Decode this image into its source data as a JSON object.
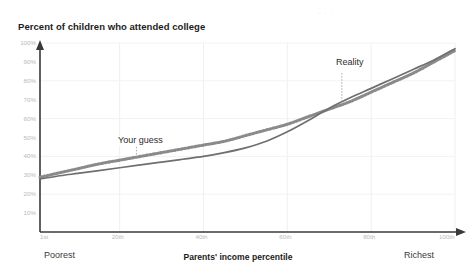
{
  "meta": {
    "watermark_text": "·  ·  ·"
  },
  "chart_data": {
    "type": "line",
    "title": "Percent of children who attended college",
    "subtitle": "",
    "xlabel": "Parents' income percentile",
    "ylabel": "",
    "xlim": [
      1,
      100
    ],
    "ylim": [
      0,
      100
    ],
    "grid": true,
    "legend_position": "inline-annotations",
    "x_tick_labels": [
      "1st",
      "20th",
      "40th",
      "60th",
      "80th",
      "100th"
    ],
    "x_tick_values": [
      1,
      20,
      40,
      60,
      80,
      100
    ],
    "y_tick_labels": [
      "10%",
      "20%",
      "30%",
      "40%",
      "50%",
      "60%",
      "70%",
      "80%",
      "90%",
      "100%"
    ],
    "y_tick_values": [
      10,
      20,
      30,
      40,
      50,
      60,
      70,
      80,
      90,
      100
    ],
    "x_end_labels": {
      "left": "Poorest",
      "right": "Richest"
    },
    "x": [
      1,
      5,
      10,
      15,
      20,
      25,
      30,
      35,
      40,
      45,
      50,
      55,
      60,
      65,
      70,
      75,
      80,
      85,
      90,
      95,
      100
    ],
    "series": [
      {
        "name": "Your guess",
        "style": "dashed",
        "color": "#8a8a8a",
        "annotation": "Your guess",
        "annotation_x": 24,
        "annotation_y": 45,
        "values": [
          29,
          31,
          33.5,
          36,
          38,
          40,
          42,
          44,
          46,
          48,
          51,
          54,
          57,
          61,
          65,
          69,
          74,
          79,
          84,
          90,
          96
        ]
      },
      {
        "name": "Reality",
        "style": "solid",
        "color": "#6f6f6f",
        "annotation": "Reality",
        "annotation_x": 73,
        "annotation_y": 84,
        "values": [
          28,
          29.5,
          31,
          32.5,
          34,
          35.5,
          37,
          38.5,
          40,
          42,
          44.5,
          48,
          53,
          59,
          65.5,
          71,
          76,
          81,
          86,
          91,
          97
        ]
      }
    ]
  }
}
